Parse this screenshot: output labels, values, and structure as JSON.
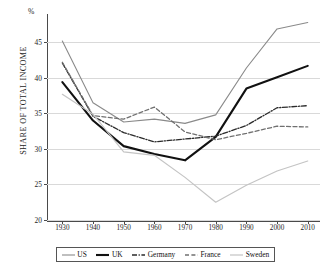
{
  "chart_data": {
    "type": "line",
    "title": "",
    "subtitle": "",
    "xlabel": "",
    "ylabel": "SHARE OF TOTAL INCOME",
    "unit_symbol": "%",
    "x": [
      1930,
      1940,
      1950,
      1960,
      1970,
      1980,
      1990,
      2000,
      2010
    ],
    "xticklabels": [
      "1930",
      "1940",
      "1950",
      "1960",
      "1970",
      "1980",
      "1990",
      "2000",
      "2010"
    ],
    "yticklabels": [
      "20",
      "25",
      "30",
      "35",
      "40",
      "45"
    ],
    "yticks": [
      20,
      25,
      30,
      35,
      40,
      45
    ],
    "ylim": [
      20,
      49
    ],
    "xlim": [
      1925,
      2014
    ],
    "grid": "horizontal",
    "legend_position": "bottom",
    "series": [
      {
        "name": "US",
        "style": "solid-thin-gray",
        "color": "#8a8a8a",
        "values": [
          45.2,
          36.5,
          33.8,
          34.2,
          33.6,
          34.8,
          41.4,
          46.9,
          47.8
        ]
      },
      {
        "name": "UK",
        "style": "solid-thick-black",
        "color": "#111111",
        "values": [
          39.4,
          34.0,
          30.4,
          29.3,
          28.4,
          31.7,
          38.5,
          40.1,
          41.7
        ]
      },
      {
        "name": "Germany",
        "style": "dash-dot",
        "color": "#2b2b2b",
        "values": [
          42.1,
          34.6,
          32.3,
          31.0,
          31.4,
          31.8,
          33.3,
          35.8,
          36.1
        ]
      },
      {
        "name": "France",
        "style": "dashed",
        "color": "#707070",
        "values": [
          42.2,
          34.7,
          34.2,
          35.9,
          32.4,
          31.3,
          32.2,
          33.2,
          33.1
        ]
      },
      {
        "name": "Sweden",
        "style": "solid-light-gray",
        "color": "#c4c4c4",
        "values": [
          37.7,
          34.9,
          29.6,
          29.1,
          26.0,
          22.5,
          24.9,
          26.9,
          28.3
        ]
      }
    ]
  },
  "legend": {
    "items": [
      {
        "label": "US"
      },
      {
        "label": "UK"
      },
      {
        "label": "Germany"
      },
      {
        "label": "France"
      },
      {
        "label": "Sweden"
      }
    ]
  }
}
